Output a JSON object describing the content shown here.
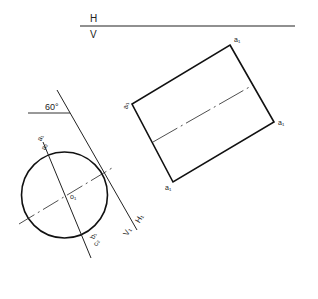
{
  "diagram": {
    "type": "descriptive-geometry-projection",
    "ground_line": {
      "upper_label": "H",
      "lower_label": "V"
    },
    "auxiliary_axis": {
      "upper_label": "H₁",
      "lower_label": "V₁"
    },
    "angle_label": "60°",
    "circle_labels": {
      "top_1": "a₁",
      "top_2": "a₂",
      "center": "o₁",
      "bottom_1": "b₁",
      "bottom_2": "c₂"
    },
    "rectangle_labels": {
      "top": "a₁",
      "left": "a₁",
      "right": "a₁",
      "bottom": "a₁"
    },
    "colors": {
      "ink": "#222222",
      "background": "#ffffff"
    }
  }
}
